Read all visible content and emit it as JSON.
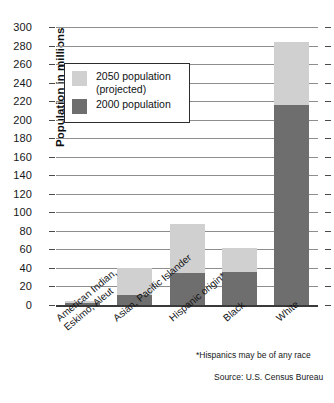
{
  "chart_data": {
    "type": "bar",
    "stacked": true,
    "title": "",
    "xlabel": "",
    "ylabel": "Population in millions",
    "ylim": [
      0,
      300
    ],
    "ytick_step": 20,
    "yticks": [
      0,
      20,
      40,
      60,
      80,
      100,
      120,
      140,
      160,
      180,
      200,
      220,
      240,
      260,
      280,
      300
    ],
    "grid": true,
    "legend_position": "upper-left-inside",
    "categories": [
      "American Indian, Eskimo, Aleut",
      "Asian, Pacific Islander",
      "Hispanic origin*",
      "Black",
      "White"
    ],
    "category_lines": [
      [
        "American Indian,",
        "Eskimo, Aleut"
      ],
      [
        "Asian, Pacific Islander"
      ],
      [
        "Hispanic origin*"
      ],
      [
        "Black"
      ],
      [
        "White"
      ]
    ],
    "series": [
      {
        "name": "2000 population",
        "color": "#6e6e6e",
        "values": [
          2,
          11,
          35,
          36,
          216
        ]
      },
      {
        "name": "2050 population (projected)",
        "color": "#d0d0d0",
        "values": [
          4,
          40,
          87,
          61,
          284
        ]
      }
    ],
    "annotations": [
      "*Hispanics may be of any race",
      "Source: U.S. Census Bureau"
    ]
  },
  "axis": {
    "y_title": "Population in millions",
    "labels": [
      "300",
      "280",
      "260",
      "240",
      "220",
      "200",
      "180",
      "160",
      "140",
      "120",
      "100",
      "80",
      "60",
      "40",
      "20",
      "0"
    ]
  },
  "legend": {
    "items": [
      {
        "label_line1": "2050 population",
        "label_line2": "(projected)",
        "color": "#d0d0d0",
        "swatch": "light-gray-swatch"
      },
      {
        "label_line1": "2000 population",
        "label_line2": "",
        "color": "#6e6e6e",
        "swatch": "dark-gray-swatch"
      }
    ]
  },
  "categories": [
    {
      "line1": "American Indian,",
      "line2": "Eskimo, Aleut"
    },
    {
      "line1": "Asian, Pacific Islander",
      "line2": ""
    },
    {
      "line1": "Hispanic origin*",
      "line2": ""
    },
    {
      "line1": "Black",
      "line2": ""
    },
    {
      "line1": "White",
      "line2": ""
    }
  ],
  "footnotes": {
    "note": "*Hispanics may be of any race",
    "source": "Source: U.S. Census Bureau"
  },
  "colors": {
    "projected_2050": "#d0d0d0",
    "population_2000": "#6e6e6e",
    "gridline": "#8e8e8e",
    "axis": "#3a3a3a",
    "text": "#111315"
  }
}
